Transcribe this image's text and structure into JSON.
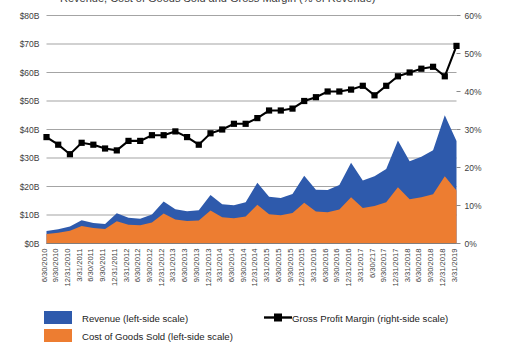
{
  "title": "Revenue, Cost of Goods Sold and Gross Margin (% of Revenue)",
  "legend": {
    "revenue_label": "Revenue (left-side scale)",
    "cogs_label": "Cost of Goods Sold (left-side scale)",
    "margin_label": "Gross Profit Margin (right-side scale)",
    "revenue_color": "#2E5AAC",
    "cogs_color": "#ED7D31",
    "margin_color": "#000000"
  },
  "chart_data": {
    "type": "area",
    "title": "Revenue, Cost of Goods Sold and Gross Margin (% of Revenue)",
    "xlabel": "",
    "ylabel": "",
    "grid": true,
    "legend_position": "bottom",
    "ylim": [
      0,
      80
    ],
    "y2lim": [
      0,
      60
    ],
    "ytick_labels": [
      "$0B",
      "$10B",
      "$20B",
      "$30B",
      "$40B",
      "$50B",
      "$60B",
      "$70B",
      "$80B"
    ],
    "ytick_values": [
      0,
      10,
      20,
      30,
      40,
      50,
      60,
      70,
      80
    ],
    "y2tick_labels": [
      "0%",
      "10%",
      "20%",
      "30%",
      "40%",
      "50%",
      "60%"
    ],
    "y2tick_values": [
      0,
      10,
      20,
      30,
      40,
      50,
      60
    ],
    "categories": [
      "6/30/2010",
      "9/30/2010",
      "12/31/2010",
      "3/31/2011",
      "6/30/2011",
      "9/30/2011",
      "12/31/2011",
      "3/31/2012",
      "6/30/2012",
      "9/30/2012",
      "12/31/2012",
      "3/31/2013",
      "6/30/2013",
      "9/30/2013",
      "12/31/2013",
      "3/31/2014",
      "6/30/2014",
      "9/30/2014",
      "12/31/2014",
      "3/31/2015",
      "6/30/2015",
      "9/30/2015",
      "12/31/2015",
      "3/31/2016",
      "6/30/2016",
      "9/30/2016",
      "12/31/2016",
      "3/31/2017",
      "6/30/217",
      "9/30/2017",
      "12/31/2017",
      "3/31/2018",
      "6/30/2018",
      "9/30/2018",
      "12/31/2018",
      "3/31/2019"
    ],
    "series": [
      {
        "name": "Revenue (left-side scale)",
        "axis": "left",
        "color": "#2E5AAC",
        "render": "area",
        "values": [
          4.4,
          5.0,
          6.0,
          8.2,
          7.2,
          6.8,
          10.6,
          9.0,
          8.7,
          10.2,
          14.7,
          12.0,
          11.3,
          11.7,
          17.0,
          13.8,
          13.4,
          14.5,
          21.3,
          16.4,
          16.0,
          17.4,
          23.8,
          18.9,
          18.8,
          20.5,
          28.3,
          22.1,
          23.6,
          26.1,
          36.1,
          28.9,
          30.4,
          32.7,
          45.0,
          36.0
        ]
      },
      {
        "name": "Cost of Goods Sold (left-side scale)",
        "axis": "left",
        "color": "#ED7D31",
        "render": "area",
        "values": [
          3.3,
          3.8,
          4.5,
          6.1,
          5.4,
          5.1,
          7.8,
          6.6,
          6.4,
          7.4,
          10.5,
          8.4,
          7.9,
          8.1,
          11.6,
          9.2,
          8.9,
          9.5,
          13.6,
          10.3,
          9.9,
          10.7,
          14.3,
          11.2,
          11.0,
          11.9,
          16.2,
          12.5,
          13.2,
          14.5,
          19.7,
          15.5,
          16.2,
          17.3,
          23.6,
          18.6
        ]
      },
      {
        "name": "Gross Profit Margin (right-side scale)",
        "axis": "right",
        "color": "#000000",
        "render": "line-marker",
        "values": [
          28.0,
          26.0,
          23.5,
          26.5,
          26.0,
          25.0,
          24.5,
          27.0,
          27.0,
          28.5,
          28.5,
          29.5,
          28.0,
          26.0,
          29.0,
          30.0,
          31.5,
          31.5,
          33.0,
          35.0,
          35.0,
          35.5,
          37.5,
          38.5,
          40.0,
          40.0,
          40.5,
          41.5,
          39.0,
          41.5,
          44.0,
          45.0,
          46.0,
          46.5,
          44.0,
          52.0
        ]
      }
    ]
  }
}
